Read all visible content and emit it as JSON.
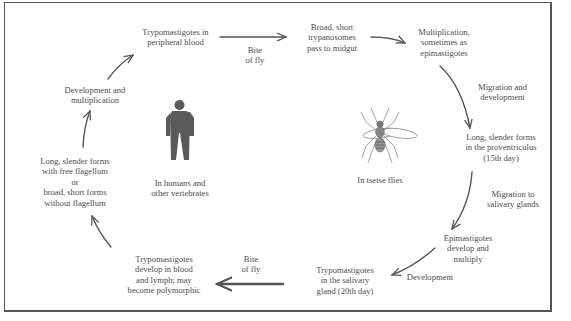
{
  "diagram": {
    "hosts": {
      "vertebrate": {
        "label": "In humans and\nother vertebrates",
        "icon": "human-silhouette-icon"
      },
      "insect": {
        "label": "In tsetse flies",
        "icon": "tsetse-fly-icon"
      }
    },
    "stages": [
      {
        "id": "s1",
        "text": "Trypomastigotes in\nperipheral blood"
      },
      {
        "id": "s2",
        "text": "Broad, short\ntrypanosomes\npass to midgut"
      },
      {
        "id": "s3",
        "text": "Multiplication,\nsometimes as\nepimastigotes"
      },
      {
        "id": "s4",
        "text": "Long, slender forms\nin the proventriculus\n(15th day)"
      },
      {
        "id": "s5",
        "text": "Epimastigotes\ndevelop and\nmultiply"
      },
      {
        "id": "s6",
        "text": "Trypomastigotes\nin the salivary\ngland (20th day)"
      },
      {
        "id": "s7",
        "text": "Trypomastigotes\ndevelop in blood\nand lymph; may\nbecome polymorphic"
      },
      {
        "id": "s8",
        "text": "Long, slender forms\nwith free flagellum\nor\nbroad, short forms\nwithout flagellum"
      },
      {
        "id": "s9",
        "text": "Development and\nmultiplication"
      }
    ],
    "transitions": [
      {
        "from": "s1",
        "to": "s2",
        "label": "Bite\nof fly"
      },
      {
        "from": "s2",
        "to": "s3",
        "label": ""
      },
      {
        "from": "s3",
        "to": "s4",
        "label": "Migration and\ndevelopment"
      },
      {
        "from": "s4",
        "to": "s5",
        "label": "Migration to\nsalivary glands"
      },
      {
        "from": "s5",
        "to": "s6",
        "label": "Development"
      },
      {
        "from": "s6",
        "to": "s7",
        "label": "Bite\nof fly"
      },
      {
        "from": "s7",
        "to": "s8",
        "label": ""
      },
      {
        "from": "s8",
        "to": "s9",
        "label": ""
      },
      {
        "from": "s9",
        "to": "s1",
        "label": ""
      }
    ],
    "colors": {
      "text": "#4d4d4d",
      "arrow": "#555555",
      "figure": "#555555",
      "border": "#555555"
    }
  }
}
